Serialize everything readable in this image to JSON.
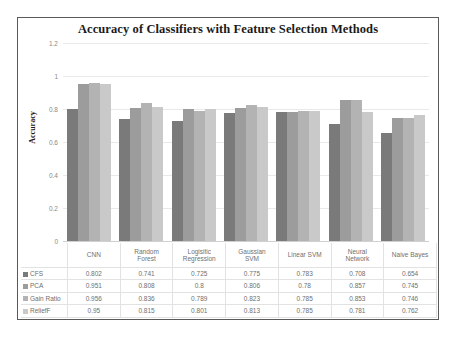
{
  "chart_data": {
    "type": "bar",
    "title": "Accuracy of Classifiers with Feature Selection Methods",
    "xlabel": "",
    "ylabel": "Accuracy",
    "ylim": [
      0,
      1.2
    ],
    "ytick_labels": [
      "1.2",
      "1",
      "0.8",
      "0.6",
      "0.4",
      "0.2",
      "0"
    ],
    "ytick_values": [
      1.2,
      1,
      0.8,
      0.6,
      0.4,
      0.2,
      0
    ],
    "grid": true,
    "legend_position": "data-table",
    "categories": [
      "CNN",
      "Random Forest",
      "Logisitic Regression",
      "Gaussian SVM",
      "Linear SVM",
      "Neural Network",
      "Naive Bayes"
    ],
    "category_lines": [
      [
        "CNN"
      ],
      [
        "Random",
        "Forest"
      ],
      [
        "Logisitic",
        "Regression"
      ],
      [
        "Gaussian",
        "SVM"
      ],
      [
        "Linear SVM"
      ],
      [
        "Neural",
        "Network"
      ],
      [
        "Naive Bayes"
      ]
    ],
    "series": [
      {
        "name": "CFS",
        "color": "#7a7a7a",
        "values": [
          0.802,
          0.741,
          0.725,
          0.775,
          0.783,
          0.708,
          0.654
        ],
        "labels": [
          "0.802",
          "0.741",
          "0.725",
          "0.775",
          "0.783",
          "0.708",
          "0.654"
        ]
      },
      {
        "name": "PCA",
        "color": "#9c9c9c",
        "values": [
          0.951,
          0.808,
          0.8,
          0.806,
          0.78,
          0.857,
          0.745
        ],
        "labels": [
          "0.951",
          "0.808",
          "0.8",
          "0.806",
          "0.78",
          "0.857",
          "0.745"
        ]
      },
      {
        "name": "Gain Ratio",
        "color": "#b3b3b3",
        "values": [
          0.956,
          0.836,
          0.789,
          0.823,
          0.785,
          0.853,
          0.746
        ],
        "labels": [
          "0.956",
          "0.836",
          "0.789",
          "0.823",
          "0.785",
          "0.853",
          "0.746"
        ]
      },
      {
        "name": "ReliefF",
        "color": "#c9c9c9",
        "values": [
          0.95,
          0.815,
          0.801,
          0.813,
          0.785,
          0.781,
          0.762
        ],
        "labels": [
          "0.95",
          "0.815",
          "0.801",
          "0.813",
          "0.785",
          "0.781",
          "0.762"
        ]
      }
    ]
  }
}
